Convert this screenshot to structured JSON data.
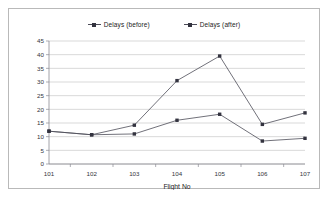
{
  "chart_data": {
    "type": "line",
    "title": "",
    "xlabel": "Flight No",
    "ylabel": "",
    "categories": [
      "101",
      "102",
      "103",
      "104",
      "105",
      "106",
      "107"
    ],
    "series": [
      {
        "name": "Delays (before)",
        "color": "#4c4c58",
        "values": [
          12,
          10.7,
          14.2,
          30.5,
          39.5,
          14.5,
          18.7
        ]
      },
      {
        "name": "Delays (after)",
        "color": "#4c4c58",
        "values": [
          12,
          10.7,
          11,
          16,
          18.2,
          8.4,
          9.4
        ]
      }
    ],
    "ylim": [
      0,
      45
    ],
    "ytick_step": 5,
    "yticks": [
      "0",
      "5",
      "10",
      "15",
      "20",
      "25",
      "30",
      "35",
      "40",
      "45"
    ],
    "grid": true,
    "legend_position": "top"
  },
  "legend": {
    "entries": [
      {
        "label": "Delays (before)"
      },
      {
        "label": "Delays (after)"
      }
    ]
  },
  "axes": {
    "x_title": "Flight No"
  },
  "colors": {
    "series_line": "#4c4c58",
    "marker": "#33333f",
    "gridline": "#c9c9c9",
    "axis": "#8b8b93",
    "frame_border": "#b9b9b9",
    "background": "#ffffff"
  }
}
